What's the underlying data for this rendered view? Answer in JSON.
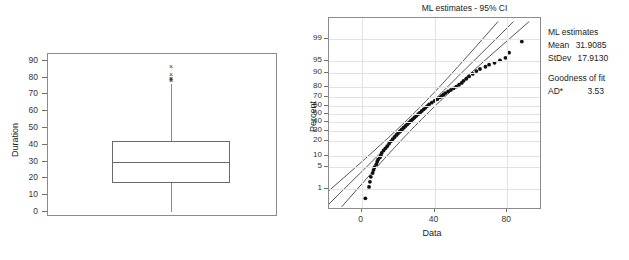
{
  "figure": {
    "title_cut": "Probability Plot of Duration",
    "subtitle": "ML estimates - 95% CI"
  },
  "boxplot": {
    "y_axis_label": "Duration",
    "y_ticks": [
      "0",
      "10",
      "20",
      "30",
      "40",
      "50",
      "60",
      "70",
      "80",
      "90"
    ],
    "y_tick_values": [
      0,
      10,
      20,
      30,
      40,
      50,
      60,
      70,
      80,
      90
    ],
    "outlier_marker": "×"
  },
  "probplot": {
    "y_axis_label": "Percent",
    "x_axis_label": "Data",
    "y_ticks": [
      "1",
      "5",
      "10",
      "20",
      "30",
      "40",
      "50",
      "60",
      "70",
      "80",
      "90",
      "95",
      "99"
    ],
    "x_ticks": [
      "0",
      "40",
      "80"
    ]
  },
  "legend": {
    "heading_estimates": "ML estimates",
    "mean_key": "Mean",
    "mean_value": "31.9085",
    "stdev_key": "StDev",
    "stdev_value": "17.9130",
    "heading_fit": "Goodness of fit",
    "ad_key": "AD*",
    "ad_value": "3.53"
  },
  "colors": {
    "frame": "#8b8b8b",
    "grid": "#e2e2e2",
    "marker": "#111111",
    "line": "#2a2a2a",
    "text": "#222222"
  },
  "chart_data": [
    {
      "type": "box",
      "title": "",
      "xlabel": "",
      "ylabel": "Duration",
      "ylim": [
        -3,
        94
      ],
      "grid": false,
      "yticks": [
        0,
        10,
        20,
        30,
        40,
        50,
        60,
        70,
        80,
        90
      ],
      "series": [
        {
          "name": "Duration",
          "min_whisker": 0.0,
          "q1": 17.5,
          "median": 29.5,
          "q3": 42.5,
          "max_whisker": 76.0,
          "outliers": [
            87.0,
            82.0,
            80.0,
            79.5,
            79.0,
            78.5
          ]
        }
      ]
    },
    {
      "type": "scatter",
      "title": "ML estimates - 95% CI",
      "xlabel": "Data",
      "ylabel": "Percent",
      "xlim": [
        -18,
        98
      ],
      "xticks": [
        0,
        40,
        80
      ],
      "yticks_percent": [
        1,
        5,
        10,
        20,
        30,
        40,
        50,
        60,
        70,
        80,
        90,
        95,
        99
      ],
      "grid": true,
      "legend_position": "right",
      "annotations": [
        {
          "text": "ML estimates"
        },
        {
          "text": "Mean  31.9085"
        },
        {
          "text": "StDev 17.9130"
        },
        {
          "text": "Goodness of fit"
        },
        {
          "text": "AD*   3.53"
        }
      ],
      "fit_line": {
        "mean": 31.9085,
        "stdev": 17.913,
        "ci": 95
      },
      "points": [
        {
          "x": 2.0,
          "p": 0.45
        },
        {
          "x": 4.0,
          "p": 1.2
        },
        {
          "x": 4.5,
          "p": 1.8
        },
        {
          "x": 5.0,
          "p": 2.6
        },
        {
          "x": 6.0,
          "p": 3.4
        },
        {
          "x": 6.5,
          "p": 4.2
        },
        {
          "x": 7.0,
          "p": 5.0
        },
        {
          "x": 8.0,
          "p": 6.0
        },
        {
          "x": 8.5,
          "p": 7.0
        },
        {
          "x": 9.0,
          "p": 8.0
        },
        {
          "x": 10.0,
          "p": 9.0
        },
        {
          "x": 10.5,
          "p": 10.0
        },
        {
          "x": 11.0,
          "p": 11.5
        },
        {
          "x": 12.0,
          "p": 13.0
        },
        {
          "x": 13.0,
          "p": 14.5
        },
        {
          "x": 14.0,
          "p": 16.0
        },
        {
          "x": 15.0,
          "p": 18.0
        },
        {
          "x": 16.0,
          "p": 20.0
        },
        {
          "x": 17.0,
          "p": 22.0
        },
        {
          "x": 18.0,
          "p": 24.0
        },
        {
          "x": 19.0,
          "p": 26.0
        },
        {
          "x": 20.0,
          "p": 28.0
        },
        {
          "x": 21.0,
          "p": 30.0
        },
        {
          "x": 22.0,
          "p": 32.0
        },
        {
          "x": 23.0,
          "p": 34.0
        },
        {
          "x": 24.0,
          "p": 36.0
        },
        {
          "x": 25.0,
          "p": 38.0
        },
        {
          "x": 26.0,
          "p": 40.0
        },
        {
          "x": 27.0,
          "p": 42.0
        },
        {
          "x": 28.0,
          "p": 44.0
        },
        {
          "x": 29.0,
          "p": 46.0
        },
        {
          "x": 30.0,
          "p": 48.0
        },
        {
          "x": 31.0,
          "p": 50.0
        },
        {
          "x": 32.0,
          "p": 52.0
        },
        {
          "x": 33.0,
          "p": 54.0
        },
        {
          "x": 34.0,
          "p": 56.0
        },
        {
          "x": 35.0,
          "p": 58.0
        },
        {
          "x": 36.0,
          "p": 60.0
        },
        {
          "x": 37.0,
          "p": 62.0
        },
        {
          "x": 38.5,
          "p": 64.0
        },
        {
          "x": 40.0,
          "p": 66.0
        },
        {
          "x": 41.5,
          "p": 68.0
        },
        {
          "x": 43.0,
          "p": 70.0
        },
        {
          "x": 44.0,
          "p": 71.5
        },
        {
          "x": 45.0,
          "p": 73.0
        },
        {
          "x": 46.0,
          "p": 74.5
        },
        {
          "x": 47.5,
          "p": 76.0
        },
        {
          "x": 49.0,
          "p": 77.5
        },
        {
          "x": 50.5,
          "p": 79.0
        },
        {
          "x": 52.0,
          "p": 80.5
        },
        {
          "x": 53.5,
          "p": 82.0
        },
        {
          "x": 55.0,
          "p": 83.5
        },
        {
          "x": 56.0,
          "p": 85.0
        },
        {
          "x": 57.5,
          "p": 86.5
        },
        {
          "x": 59.0,
          "p": 88.0
        },
        {
          "x": 61.0,
          "p": 89.5
        },
        {
          "x": 63.0,
          "p": 91.0
        },
        {
          "x": 65.0,
          "p": 92.0
        },
        {
          "x": 68.0,
          "p": 93.0
        },
        {
          "x": 70.0,
          "p": 93.8
        },
        {
          "x": 73.0,
          "p": 94.5
        },
        {
          "x": 76.0,
          "p": 95.3
        },
        {
          "x": 79.0,
          "p": 96.0
        },
        {
          "x": 81.0,
          "p": 97.2
        },
        {
          "x": 88.0,
          "p": 98.8
        }
      ]
    }
  ]
}
